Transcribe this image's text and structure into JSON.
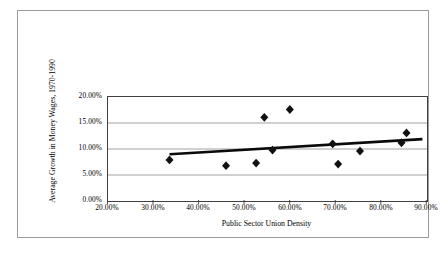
{
  "chart_data": {
    "type": "scatter",
    "title": "",
    "xlabel": "Public Sector Union Density",
    "ylabel": "Average Growth in Money Wages, 1970-1990",
    "xlim": [
      20,
      90
    ],
    "ylim": [
      0,
      20
    ],
    "xticks": [
      20,
      30,
      40,
      50,
      60,
      70,
      80,
      90
    ],
    "yticks": [
      0,
      5,
      10,
      15,
      20
    ],
    "xtick_labels": [
      "20.00%",
      "30.00%",
      "40.00%",
      "50.00%",
      "60.00%",
      "70.00%",
      "80.00%",
      "90.00%"
    ],
    "ytick_labels": [
      "0.00%",
      "5.00%",
      "10.00%",
      "15.00%",
      "20.00%"
    ],
    "grid": "horizontal",
    "legend": "none",
    "marker": "diamond",
    "marker_color": "#111111",
    "points": [
      {
        "x": 33.5,
        "y": 7.9
      },
      {
        "x": 45.9,
        "y": 6.8
      },
      {
        "x": 52.5,
        "y": 7.3
      },
      {
        "x": 54.3,
        "y": 16.1
      },
      {
        "x": 56.1,
        "y": 9.8
      },
      {
        "x": 59.9,
        "y": 17.6
      },
      {
        "x": 69.3,
        "y": 11.0
      },
      {
        "x": 70.5,
        "y": 7.1
      },
      {
        "x": 75.3,
        "y": 9.6
      },
      {
        "x": 84.4,
        "y": 11.2
      },
      {
        "x": 85.5,
        "y": 13.1
      }
    ],
    "trendline": {
      "type": "linear",
      "x_start": 33.5,
      "y_start": 9.0,
      "x_end": 89.0,
      "y_end": 11.9,
      "color": "#0a0a0a"
    }
  },
  "colors": {
    "frame": "#9a9a9a",
    "axis": "#404040",
    "gridline": "#8c8c8c",
    "background": "#ffffff",
    "marker": "#111111",
    "trendline": "#0a0a0a"
  }
}
